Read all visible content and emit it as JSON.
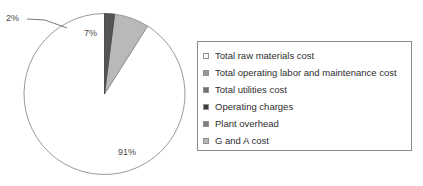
{
  "chart_data": {
    "type": "pie",
    "title": "",
    "categories": [
      "Total raw materials cost",
      "Total operating labor and maintenance cost",
      "Total utilities cost",
      "Operating charges",
      "Plant overhead",
      "G and A cost"
    ],
    "values": [
      91,
      7,
      2,
      0,
      0,
      0
    ],
    "value_labels": [
      "91%",
      "7%",
      "2%",
      "",
      "",
      ""
    ],
    "colors": [
      "#ffffff",
      "#b9b9b9",
      "#555555",
      "#3a3a3a",
      "#8f8f8f",
      "#cfcfcf"
    ],
    "legend_position": "right",
    "grid": false,
    "start_angle_deg": 0,
    "direction": "counterclockwise",
    "xlabel": "",
    "ylabel": ""
  },
  "pie": {
    "labels": {
      "slice_91": "91%",
      "slice_7": "7%",
      "slice_2": "2%"
    }
  },
  "legend": {
    "items": [
      {
        "label": "Total raw materials cost",
        "color": "#ffffff"
      },
      {
        "label": "Total operating labor and maintenance cost",
        "color": "#9a9a9a"
      },
      {
        "label": "Total utilities cost",
        "color": "#6f6f6f"
      },
      {
        "label": "Operating charges",
        "color": "#3a3a3a"
      },
      {
        "label": "Plant overhead",
        "color": "#7d7d7d"
      },
      {
        "label": "G and A cost",
        "color": "#b5b5b5"
      }
    ]
  }
}
